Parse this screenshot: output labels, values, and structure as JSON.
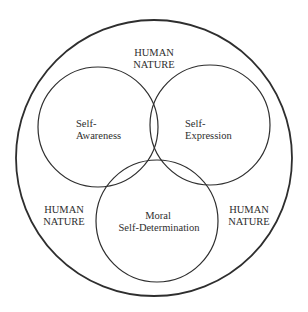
{
  "diagram": {
    "type": "venn",
    "colors": {
      "background": "#ffffff",
      "stroke": "#2e2e2e",
      "text": "#2e2e2e"
    },
    "outer": {
      "label_top": {
        "line1": "HUMAN",
        "line2": "NATURE"
      },
      "label_left": {
        "line1": "HUMAN",
        "line2": "NATURE"
      },
      "label_right": {
        "line1": "HUMAN",
        "line2": "NATURE"
      }
    },
    "sets": [
      {
        "id": "self-awareness",
        "line1": "Self-",
        "line2": "Awareness"
      },
      {
        "id": "self-expression",
        "line1": "Self-",
        "line2": "Expression"
      },
      {
        "id": "moral-self-determination",
        "line1": "Moral",
        "line2": "Self-Determination"
      }
    ]
  }
}
